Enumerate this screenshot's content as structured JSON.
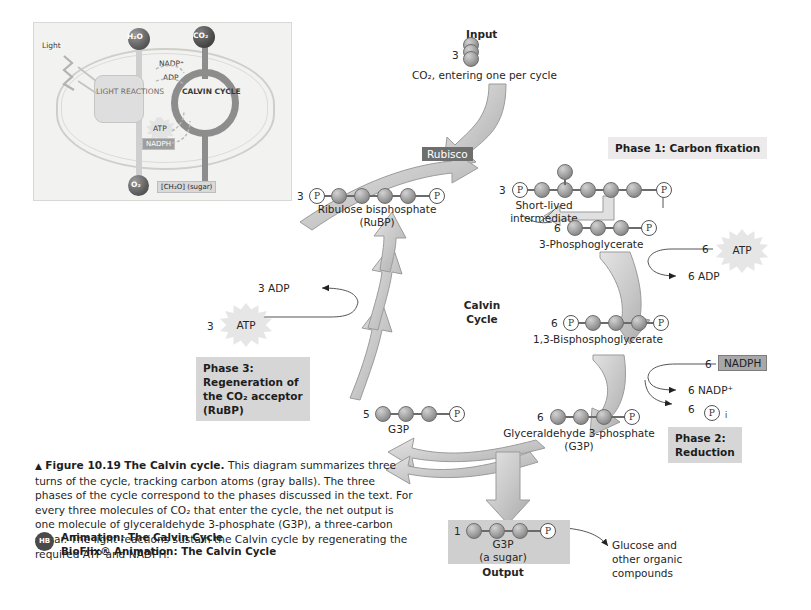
{
  "figure": {
    "number": "Figure 10.19",
    "title": "The Calvin cycle.",
    "caption": "This diagram summarizes three turns of the cycle, tracking carbon atoms (gray balls). The three phases of the cycle correspond to the phases discussed in the text. For every three molecules of CO₂ that enter the cycle, the net output is one molecule of glyceraldehyde 3-phosphate (G3P), a three-carbon sugar. The light reactions sustain the Calvin cycle by regenerating the required ATP and NADPH.",
    "triangle_marker": "▲",
    "animations": {
      "badge": "HB",
      "line1": "Animation: The Calvin Cycle",
      "line2": "BioFlix® Animation: The Calvin Cycle"
    }
  },
  "inset": {
    "name": "photosynthesis-overview-thumbnail",
    "light": "Light",
    "h2o": "H₂O",
    "co2": "CO₂",
    "light_reactions": "LIGHT REACTIONS",
    "calvin_cycle": "CALVIN CYCLE",
    "nadp_plus": "NADP⁺",
    "adp": "ADP",
    "atp": "ATP",
    "nadph": "NADPH",
    "o2": "O₂",
    "sugar": "[CH₂O] (sugar)"
  },
  "diagram": {
    "center_label_line1": "Calvin",
    "center_label_line2": "Cycle",
    "input_label": "Input",
    "input_count": "3",
    "input_caption": "CO₂, entering one per cycle",
    "enzyme": "Rubisco",
    "output_label": "Output",
    "glucose_note_line1": "Glucose and",
    "glucose_note_line2": "other organic",
    "glucose_note_line3": "compounds",
    "phases": [
      {
        "id": "phase1",
        "text": "Phase 1: Carbon fixation"
      },
      {
        "id": "phase2",
        "line1": "Phase 2:",
        "line2": "Reduction"
      },
      {
        "id": "phase3",
        "line1": "Phase 3:",
        "line2": "Regeneration of",
        "line3": "the CO₂ acceptor",
        "line4": "(RuBP)"
      }
    ],
    "molecules": [
      {
        "id": "intermediate",
        "count": "3",
        "label_line1": "Short-lived",
        "label_line2": "intermediate",
        "left_cap": "P",
        "right_cap": "P",
        "carbons": 6,
        "branch": true
      },
      {
        "id": "3-phosphoglycerate",
        "count": "6",
        "label_line1": "3-Phosphoglycerate",
        "left_cap": "",
        "right_cap": "P",
        "carbons": 3,
        "branch": false
      },
      {
        "id": "1-3-bisphosphoglycerate",
        "count": "6",
        "label_line1": "1,3-Bisphosphoglycerate",
        "left_cap": "P",
        "right_cap": "P",
        "carbons": 3,
        "branch": false
      },
      {
        "id": "glyceraldehyde-3-phosphate",
        "count": "6",
        "label_line1": "Glyceraldehyde 3-phosphate",
        "label_line2": "(G3P)",
        "left_cap": "",
        "right_cap": "P",
        "carbons": 3,
        "branch": false
      },
      {
        "id": "g3p-output",
        "count": "1",
        "label_line1": "G3P",
        "label_line2": "(a sugar)",
        "left_cap": "",
        "right_cap": "P",
        "carbons": 3,
        "branch": false
      },
      {
        "id": "g3p-regeneration",
        "count": "5",
        "label_line1": "G3P",
        "left_cap": "",
        "right_cap": "P",
        "carbons": 3,
        "branch": false
      },
      {
        "id": "ribulose-bisphosphate",
        "count": "3",
        "label_line1": "Ribulose bisphosphate",
        "label_line2": "(RuBP)",
        "left_cap": "P",
        "right_cap": "P",
        "carbons": 5,
        "branch": false
      }
    ],
    "cofactors": [
      {
        "id": "atp-phase2",
        "count": "6",
        "label": "ATP",
        "shape": "burst"
      },
      {
        "id": "adp-phase2",
        "text": "6 ADP"
      },
      {
        "id": "nadph-phase2",
        "count": "6",
        "label": "NADPH",
        "shape": "box"
      },
      {
        "id": "nadp-phase2",
        "text": "6 NADP⁺"
      },
      {
        "id": "pi-phase2",
        "count": "6",
        "label": "P",
        "subscript": "i"
      },
      {
        "id": "atp-phase3",
        "count": "3",
        "label": "ATP",
        "shape": "burst"
      },
      {
        "id": "adp-phase3",
        "text": "3 ADP"
      }
    ]
  },
  "colors": {
    "ball": "#9d9d9d",
    "phase_box": "#d6d6d6",
    "rubisco_box": "#6e6e6e",
    "nadph_box": "#a8a8a8",
    "arrow_fill": "#cfcfcf",
    "output_box": "#cfcfcf",
    "text": "#262626"
  }
}
